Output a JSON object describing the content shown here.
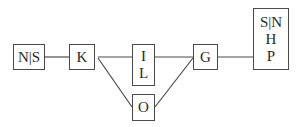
{
  "diagram": {
    "nodes": [
      {
        "id": "ns",
        "lines": [
          "N|S"
        ]
      },
      {
        "id": "k",
        "lines": [
          "K"
        ]
      },
      {
        "id": "il",
        "lines": [
          "I",
          "L"
        ]
      },
      {
        "id": "o",
        "lines": [
          "O"
        ]
      },
      {
        "id": "g",
        "lines": [
          "G"
        ]
      },
      {
        "id": "snhp",
        "lines": [
          "S|N",
          "H",
          "P"
        ]
      }
    ],
    "edges": [
      {
        "from": "ns",
        "to": "k"
      },
      {
        "from": "k",
        "to": "il"
      },
      {
        "from": "k",
        "to": "o"
      },
      {
        "from": "il",
        "to": "g"
      },
      {
        "from": "o",
        "to": "g"
      },
      {
        "from": "g",
        "to": "snhp"
      }
    ],
    "colors": {
      "stroke": "#4a4a4a",
      "text": "#2a2a2a",
      "background": "#ffffff"
    }
  }
}
